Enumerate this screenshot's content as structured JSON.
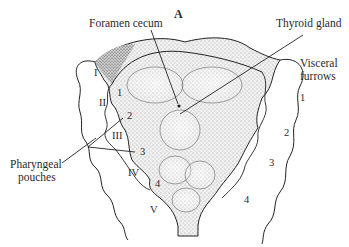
{
  "figure": {
    "panel_label": "A",
    "callouts": {
      "foramen_cecum": "Foramen cecum",
      "thyroid_gland": "Thyroid gland",
      "visceral_furrows_line1": "Visceral",
      "visceral_furrows_line2": "furrows",
      "pharyngeal_pouches_line1": "Pharyngeal",
      "pharyngeal_pouches_line2": "pouches"
    },
    "arches": [
      "I",
      "II",
      "III",
      "IV",
      "V"
    ],
    "pouches": [
      "1",
      "2",
      "3",
      "4"
    ],
    "furrows": [
      "1",
      "2",
      "3",
      "4"
    ]
  }
}
